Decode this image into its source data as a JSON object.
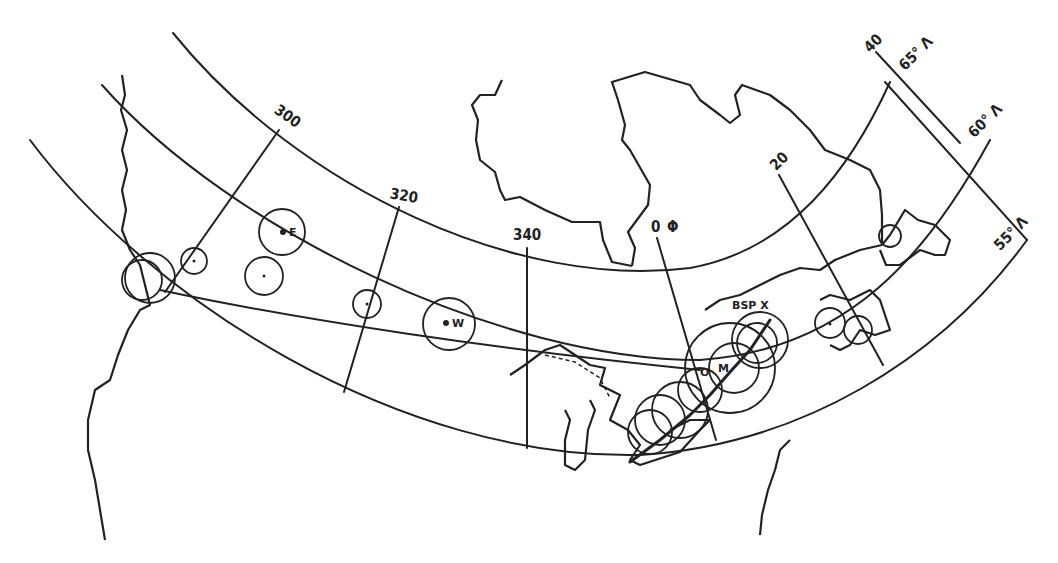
{
  "map": {
    "title": "",
    "colors": {
      "ink": "#222222",
      "background": "#ffffff"
    },
    "meridian_labels": [
      {
        "id": "m300",
        "text": "300"
      },
      {
        "id": "m320",
        "text": "320"
      },
      {
        "id": "m340",
        "text": "340"
      },
      {
        "id": "m0",
        "text": "0"
      },
      {
        "id": "m0_symbol",
        "text": "Φ"
      },
      {
        "id": "m20",
        "text": "20"
      },
      {
        "id": "m40",
        "text": "40"
      }
    ],
    "latitude_labels": [
      {
        "id": "lat65",
        "text": "65° Λ"
      },
      {
        "id": "lat60",
        "text": "60° Λ"
      },
      {
        "id": "lat55",
        "text": "55° Λ"
      }
    ],
    "station_labels": [
      {
        "id": "E",
        "text": "E"
      },
      {
        "id": "W",
        "text": "W"
      },
      {
        "id": "BSP",
        "text": "BSP X"
      },
      {
        "id": "M",
        "text": "M"
      },
      {
        "id": "O",
        "text": "O"
      }
    ]
  }
}
